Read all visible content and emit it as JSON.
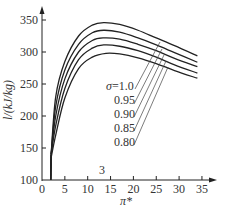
{
  "chart_data": {
    "type": "line",
    "title": "",
    "xlabel": "π*",
    "ylabel": "l/(kJ/kg)",
    "xlim": [
      0,
      37
    ],
    "ylim": [
      100,
      355
    ],
    "x_ticks": [
      0,
      5,
      10,
      15,
      20,
      25,
      30,
      35
    ],
    "y_ticks": [
      100,
      150,
      200,
      250,
      300,
      350
    ],
    "grid": false,
    "legend_position": "inline leader-line labels, center-right",
    "annotations": [
      "3"
    ],
    "series": [
      {
        "name": "σ=1.0",
        "x": [
          2,
          3,
          5,
          8,
          11,
          13.5,
          17,
          21,
          25,
          29,
          34
        ],
        "values": [
          140,
          230,
          285,
          325,
          342,
          346,
          343,
          334,
          322,
          310,
          294
        ]
      },
      {
        "name": "0.95",
        "x": [
          2,
          3,
          5,
          8,
          11,
          13.5,
          17,
          21,
          25,
          29,
          34
        ],
        "values": [
          140,
          215,
          272,
          312,
          330,
          334,
          331,
          322,
          311,
          299,
          284
        ]
      },
      {
        "name": "0.90",
        "x": [
          2,
          3,
          5,
          8,
          11,
          13.5,
          17,
          21,
          25,
          29,
          34
        ],
        "values": [
          140,
          200,
          258,
          300,
          318,
          322,
          320,
          312,
          302,
          290,
          277
        ]
      },
      {
        "name": "0.85",
        "x": [
          2,
          3,
          5,
          8,
          11,
          13.5,
          17,
          21,
          25,
          29,
          34
        ],
        "values": [
          140,
          185,
          243,
          288,
          306,
          311,
          309,
          302,
          292,
          280,
          267
        ]
      },
      {
        "name": "0.80",
        "x": [
          2,
          3,
          5,
          8,
          11,
          14,
          17,
          21,
          25,
          29,
          34
        ],
        "values": [
          135,
          170,
          228,
          274,
          292,
          298,
          297,
          291,
          282,
          271,
          259
        ]
      }
    ],
    "labels": {
      "sigma_prefix": "σ=1.0",
      "l95": "0.95",
      "l90": "0.90",
      "l85": "0.85",
      "l80": "0.80",
      "annotation": "3",
      "xlabel": "π*",
      "ylabel": "l/(kJ/kg)"
    }
  }
}
